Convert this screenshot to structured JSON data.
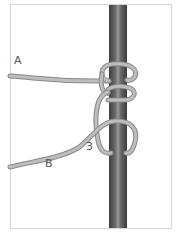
{
  "diagram": {
    "type": "knot-illustration",
    "labels": {
      "a": "A",
      "b": "B",
      "step": "3"
    },
    "colors": {
      "rope": "#b9b9b9",
      "rope_edge": "#8a8a8a",
      "pole_dark": "#4a4a4a",
      "pole_light": "#8c8c8c",
      "frame": "#d6d6d6"
    }
  }
}
